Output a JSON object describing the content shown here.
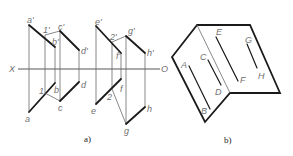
{
  "figure_a": {
    "caption": "a)",
    "axis": {
      "left_label": "X",
      "right_label": "O"
    },
    "labels": {
      "a_prime": "a'",
      "b_prime": "b'",
      "c_prime": "c'",
      "d_prime": "d'",
      "one_prime": "1'",
      "e_prime": "e'",
      "f_prime": "f'",
      "g_prime": "g'",
      "h_prime": "h'",
      "two_prime": "2'",
      "a": "a",
      "b": "b",
      "c": "c",
      "d": "d",
      "one": "1",
      "e": "e",
      "f": "f",
      "g": "g",
      "h": "h",
      "two": "2"
    }
  },
  "figure_b": {
    "caption": "b)",
    "labels": {
      "A": "A",
      "B": "B",
      "C": "C",
      "D": "D",
      "E": "E",
      "F": "F",
      "G": "G",
      "H": "H"
    }
  }
}
